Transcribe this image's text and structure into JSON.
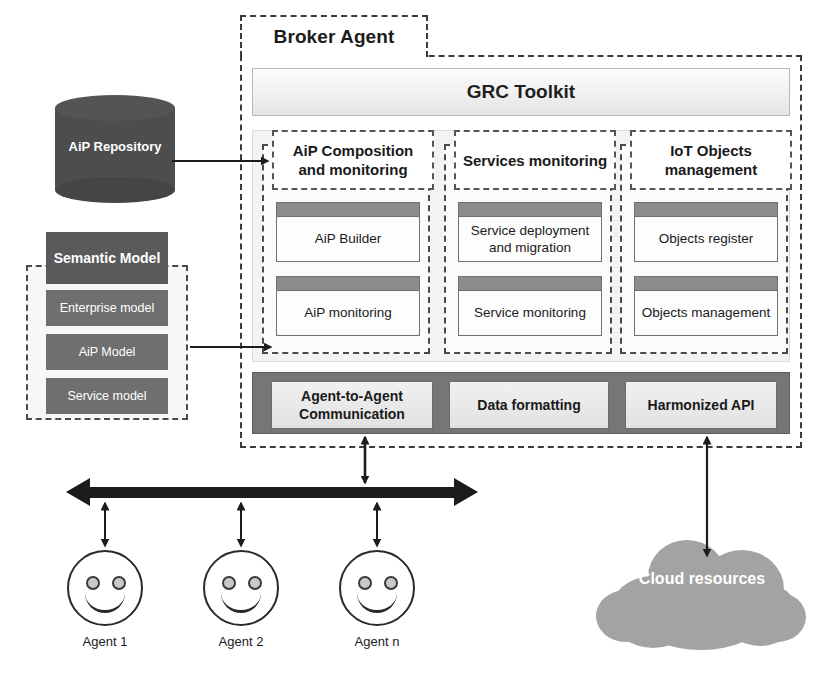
{
  "diagram": {
    "broker": {
      "title": "Broker Agent",
      "toolkit": "GRC Toolkit",
      "columns": [
        {
          "header": "AiP Composition and monitoring",
          "boxes": [
            "AiP Builder",
            "AiP monitoring"
          ]
        },
        {
          "header": "Services monitoring",
          "boxes": [
            "Service deployment and migration",
            "Service monitoring"
          ]
        },
        {
          "header": "IoT Objects management",
          "boxes": [
            "Objects register",
            "Objects management"
          ]
        }
      ],
      "services_bar": [
        "Agent-to-Agent Communication",
        "Data formatting",
        "Harmonized API"
      ]
    },
    "repository": {
      "label": "AiP Repository"
    },
    "semantic_model": {
      "header": "Semantic Model",
      "items": [
        "Enterprise model",
        "AiP Model",
        "Service model"
      ]
    },
    "agents": [
      {
        "caption": "Agent 1"
      },
      {
        "caption": "Agent 2"
      },
      {
        "caption": "Agent n"
      }
    ],
    "cloud": {
      "label": "Cloud resources"
    },
    "colors": {
      "repository_fill": "#4d4d4d",
      "semantic_fill": "#6f6f6f",
      "services_bar_fill": "#767676",
      "cloud_fill": "#a3a3a3",
      "stripe": "#8c8c8c",
      "line": "#1c1c1c"
    }
  }
}
